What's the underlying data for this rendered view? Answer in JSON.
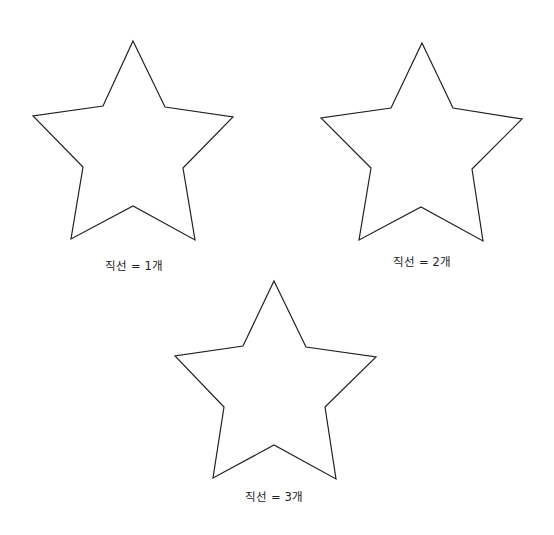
{
  "diagram": {
    "stars": [
      {
        "id": "star-1",
        "label": "직선 = 1개",
        "points": [
          [
            133,
            41
          ],
          [
            165,
            107
          ],
          [
            233,
            117
          ],
          [
            183,
            168
          ],
          [
            195,
            240
          ],
          [
            133,
            206
          ],
          [
            71,
            239
          ],
          [
            83,
            167
          ],
          [
            33,
            116
          ],
          [
            103,
            106
          ]
        ],
        "label_pos": {
          "x": 134,
          "y": 259
        }
      },
      {
        "id": "star-2",
        "label": "직선 = 2개",
        "points": [
          [
            422,
            43
          ],
          [
            453,
            108
          ],
          [
            522,
            119
          ],
          [
            472,
            169
          ],
          [
            483,
            241
          ],
          [
            421,
            207
          ],
          [
            359,
            240
          ],
          [
            371,
            168
          ],
          [
            321,
            118
          ],
          [
            391,
            108
          ]
        ],
        "label_pos": {
          "x": 422,
          "y": 255
        }
      },
      {
        "id": "star-3",
        "label": "직선 = 3개",
        "points": [
          [
            274,
            281
          ],
          [
            306,
            347
          ],
          [
            376,
            357
          ],
          [
            325,
            407
          ],
          [
            336,
            479
          ],
          [
            274,
            445
          ],
          [
            213,
            478
          ],
          [
            224,
            407
          ],
          [
            175,
            356
          ],
          [
            243,
            346
          ]
        ],
        "label_pos": {
          "x": 274,
          "y": 490
        }
      }
    ],
    "stroke_color": "#222222",
    "fill_color": "#ffffff"
  }
}
